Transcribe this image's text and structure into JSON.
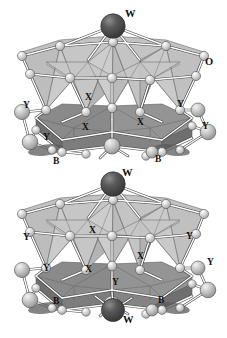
{
  "figure": {
    "type": "crystal-structure-diagram",
    "background_color": "#ffffff",
    "width": 227,
    "height": 338
  },
  "palette": {
    "background": "#ffffff",
    "tetrahedron_light": "#b9b9b9",
    "tetrahedron_light_shade": "#a6a6a6",
    "tetrahedron_light_highlight": "#cfcfcf",
    "octahedron_dark": "#8c8c8c",
    "octahedron_dark_shade": "#7a7a7a",
    "octahedron_dark_highlight": "#9c9c9c",
    "sphere_dark": "#4c4c4c",
    "sphere_dark_shade": "#3a3a3a",
    "sphere_light": "#d8d8d8",
    "sphere_light_shade": "#b0b0b0",
    "bond_stroke": "#ffffff",
    "edge_stroke": "#4a4a4a",
    "outline": "#3a3a3a",
    "label_color": "#111111"
  },
  "legend": {
    "species": [
      {
        "symbol": "W",
        "role": "tungsten-site-dark-sphere"
      },
      {
        "symbol": "O",
        "role": "oxygen-site-light-sphere"
      },
      {
        "symbol": "X",
        "role": "octahedral-cation-site"
      },
      {
        "symbol": "Y",
        "role": "interlayer-cation-site"
      },
      {
        "symbol": "B",
        "role": "bridging-site"
      }
    ]
  },
  "labels": [
    {
      "id": "w-top",
      "text": "W",
      "x": 125,
      "y": 9,
      "size": "lg"
    },
    {
      "id": "o-right",
      "text": "O",
      "x": 205,
      "y": 57,
      "size": "lg"
    },
    {
      "id": "y-upper-left",
      "text": "Y",
      "x": 23,
      "y": 101,
      "size": "md"
    },
    {
      "id": "y-upper-left-2",
      "text": "Y",
      "x": 43,
      "y": 133,
      "size": "md"
    },
    {
      "id": "x-upper-mid",
      "text": "X",
      "x": 85,
      "y": 93,
      "size": "md"
    },
    {
      "id": "x-upper-left",
      "text": "X",
      "x": 82,
      "y": 123,
      "size": "md"
    },
    {
      "id": "x-upper-right",
      "text": "X",
      "x": 137,
      "y": 118,
      "size": "md"
    },
    {
      "id": "y-upper-right",
      "text": "Y",
      "x": 177,
      "y": 100,
      "size": "md"
    },
    {
      "id": "y-upper-right-2",
      "text": "Y",
      "x": 202,
      "y": 122,
      "size": "md"
    },
    {
      "id": "b-upper-left",
      "text": "B",
      "x": 53,
      "y": 157,
      "size": "md"
    },
    {
      "id": "b-upper-right",
      "text": "B",
      "x": 155,
      "y": 155,
      "size": "md"
    },
    {
      "id": "w-middle",
      "text": "W",
      "x": 122,
      "y": 168,
      "size": "lg"
    },
    {
      "id": "y-lower-left",
      "text": "Y",
      "x": 23,
      "y": 233,
      "size": "md"
    },
    {
      "id": "y-lower-left-2",
      "text": "Y",
      "x": 43,
      "y": 264,
      "size": "md"
    },
    {
      "id": "x-lower-mid",
      "text": "X",
      "x": 89,
      "y": 226,
      "size": "md"
    },
    {
      "id": "x-lower-left",
      "text": "X",
      "x": 85,
      "y": 265,
      "size": "md"
    },
    {
      "id": "x-lower-right",
      "text": "X",
      "x": 137,
      "y": 252,
      "size": "md"
    },
    {
      "id": "y-lower-right",
      "text": "Y",
      "x": 186,
      "y": 232,
      "size": "md"
    },
    {
      "id": "y-lower-right-2",
      "text": "Y",
      "x": 207,
      "y": 258,
      "size": "md"
    },
    {
      "id": "b-lower-left",
      "text": "B",
      "x": 53,
      "y": 297,
      "size": "md"
    },
    {
      "id": "b-lower-right",
      "text": "B",
      "x": 158,
      "y": 296,
      "size": "md"
    },
    {
      "id": "y-lower-center",
      "text": "Y",
      "x": 112,
      "y": 278,
      "size": "md"
    },
    {
      "id": "w-bottom",
      "text": "W",
      "x": 123,
      "y": 315,
      "size": "lg"
    }
  ]
}
